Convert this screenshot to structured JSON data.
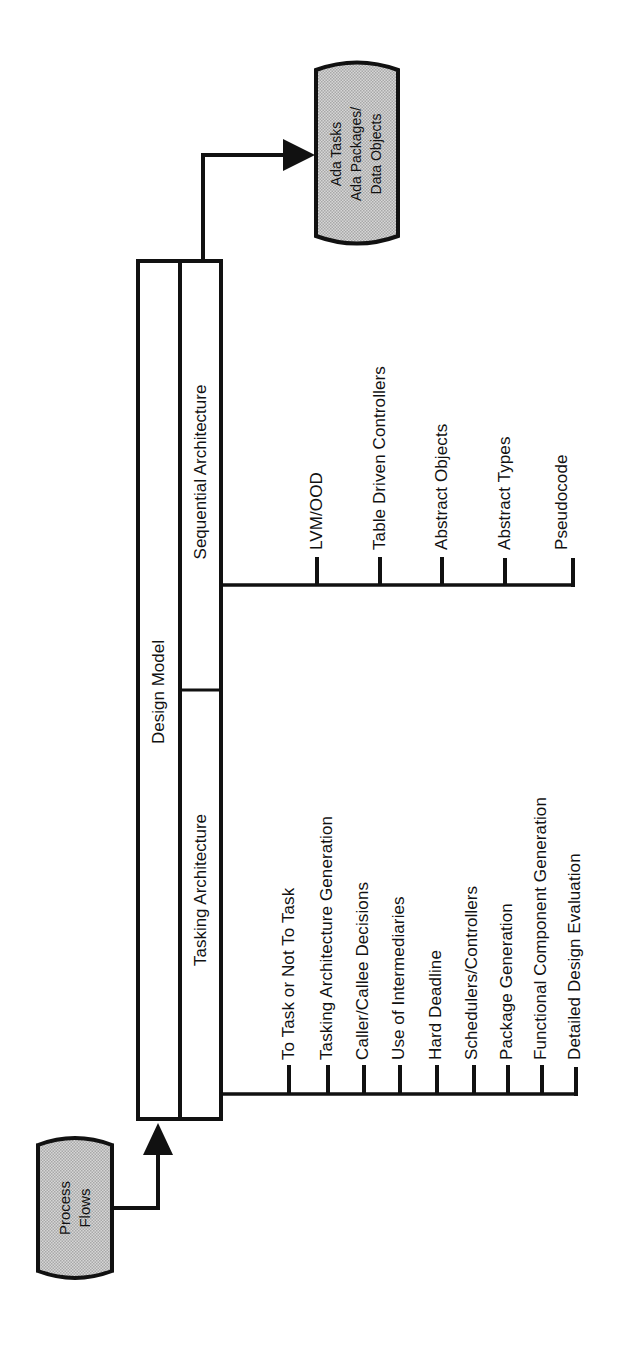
{
  "diagram": {
    "orientation": "rotated -90deg (text reads bottom-to-top)",
    "colors": {
      "line": "#111111",
      "terminal_fill": "#c6c6c6",
      "background": "#ffffff"
    },
    "input_terminal": {
      "lines": [
        "Process",
        "Flows"
      ]
    },
    "output_terminal": {
      "lines": [
        "Ada Tasks",
        "Ada Packages/",
        "Data Objects"
      ]
    },
    "design_model": {
      "title": "Design Model",
      "sections": {
        "sequential": "Sequential Architecture",
        "tasking": "Tasking Architecture"
      }
    },
    "sequential_branch": {
      "items": [
        "LVM/OOD",
        "Table Driven Controllers",
        "Abstract Objects",
        "Abstract Types",
        "Pseudocode"
      ]
    },
    "tasking_branch": {
      "items": [
        "To Task or Not To Task",
        "Tasking Architecture Generation",
        "Caller/Callee Decisions",
        "Use of Intermediaries",
        "Hard Deadline",
        "Schedulers/Controllers",
        "Package Generation",
        "Functional Component Generation",
        "Detailed Design Evaluation"
      ]
    }
  }
}
